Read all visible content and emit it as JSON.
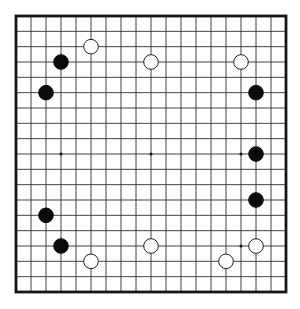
{
  "board": {
    "kind": "go-game-diagram",
    "grid_size": 19,
    "coordinate_convention": "col: 1-19 left to right, row: 1-19 top to bottom",
    "colors": {
      "background": "#ffffff",
      "grid_line": "#2e2e2e",
      "border": "#151515",
      "black_stone": "#0a0a0a",
      "white_stone": "#ffffff",
      "white_stone_outline": "#1f1f1f",
      "star_point": "#111111"
    },
    "visible_star_points": [
      {
        "col": 4,
        "row": 10
      },
      {
        "col": 10,
        "row": 10
      },
      {
        "col": 16,
        "row": 10
      },
      {
        "col": 16,
        "row": 16
      }
    ],
    "stones": [
      {
        "color": "white",
        "col": 6,
        "row": 3
      },
      {
        "color": "black",
        "col": 4,
        "row": 4
      },
      {
        "color": "white",
        "col": 10,
        "row": 4
      },
      {
        "color": "white",
        "col": 16,
        "row": 4
      },
      {
        "color": "black",
        "col": 3,
        "row": 6
      },
      {
        "color": "black",
        "col": 17,
        "row": 6
      },
      {
        "color": "black",
        "col": 17,
        "row": 10
      },
      {
        "color": "black",
        "col": 17,
        "row": 13
      },
      {
        "color": "black",
        "col": 3,
        "row": 14
      },
      {
        "color": "black",
        "col": 4,
        "row": 16
      },
      {
        "color": "white",
        "col": 17,
        "row": 16
      },
      {
        "color": "white",
        "col": 10,
        "row": 16
      },
      {
        "color": "white",
        "col": 6,
        "row": 17
      },
      {
        "color": "white",
        "col": 15,
        "row": 17
      }
    ]
  }
}
